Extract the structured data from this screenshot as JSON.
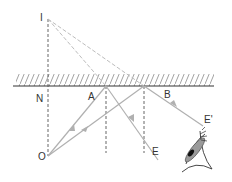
{
  "diagram": {
    "labels": {
      "image": "I",
      "normal_foot": "N",
      "reflection_point_a": "A",
      "reflection_point_b": "B",
      "object": "O",
      "ray_end_e": "E",
      "ray_end_e_prime": "E'"
    },
    "colors": {
      "mirror": "#333333",
      "hatch": "#888888",
      "ray": "#b0b0b0",
      "virtual_ray": "#bdbdbd",
      "normal": "#555555",
      "label": "#333333"
    },
    "elements": [
      {
        "kind": "mirror",
        "from": [
          13,
          86
        ],
        "to": [
          214,
          86
        ]
      },
      {
        "kind": "normal-line",
        "from": [
          48,
          18
        ],
        "to": [
          48,
          156
        ],
        "dashed": true
      },
      {
        "kind": "virtual-ray",
        "from": [
          48,
          18
        ],
        "to": [
          106,
          86
        ],
        "dashed": true
      },
      {
        "kind": "virtual-ray",
        "from": [
          48,
          18
        ],
        "to": [
          144,
          86
        ],
        "dashed": true
      },
      {
        "kind": "incident-ray",
        "from": [
          48,
          156
        ],
        "to": [
          106,
          86
        ]
      },
      {
        "kind": "incident-ray",
        "from": [
          48,
          156
        ],
        "to": [
          144,
          86
        ]
      },
      {
        "kind": "reflected-ray",
        "from": [
          106,
          86
        ],
        "to": [
          158,
          160
        ],
        "end_label": "E"
      },
      {
        "kind": "reflected-ray",
        "from": [
          144,
          86
        ],
        "to": [
          203,
          126
        ],
        "end_label": "E'"
      },
      {
        "kind": "normal-at-a",
        "from": [
          106,
          86
        ],
        "to": [
          106,
          153
        ],
        "dashed": true
      },
      {
        "kind": "normal-at-b",
        "from": [
          144,
          86
        ],
        "to": [
          144,
          153
        ],
        "dashed": true
      },
      {
        "kind": "eye",
        "position": [
          195,
          155
        ]
      }
    ]
  }
}
